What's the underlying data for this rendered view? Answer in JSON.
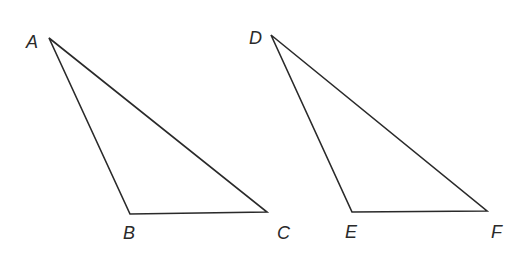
{
  "diagram": {
    "type": "geometry-triangles",
    "stroke_color": "#2a2a2a",
    "triangles": [
      {
        "name": "ABC",
        "vertices": [
          {
            "label": "A",
            "x": 49,
            "y": 38,
            "label_x": 26,
            "label_y": 48
          },
          {
            "label": "B",
            "x": 130,
            "y": 214,
            "label_x": 123,
            "label_y": 239
          },
          {
            "label": "C",
            "x": 267,
            "y": 212,
            "label_x": 277,
            "label_y": 239
          }
        ]
      },
      {
        "name": "DEF",
        "vertices": [
          {
            "label": "D",
            "x": 271,
            "y": 35,
            "label_x": 249,
            "label_y": 44
          },
          {
            "label": "E",
            "x": 352,
            "y": 212,
            "label_x": 345,
            "label_y": 238
          },
          {
            "label": "F",
            "x": 487,
            "y": 211,
            "label_x": 491,
            "label_y": 238
          }
        ]
      }
    ]
  }
}
